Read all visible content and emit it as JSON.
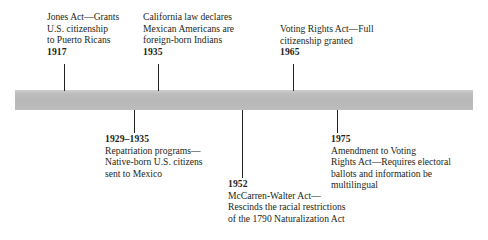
{
  "figure": {
    "type": "horizontal-timeline",
    "title": "",
    "bar": {
      "color": "#b7b7b7",
      "highlight_color": "#d2d2d2",
      "left": 15,
      "top": 90,
      "width": 458,
      "height": 20
    },
    "line_color": "#231f20",
    "background_color": "#ffffff"
  },
  "events_above": [
    {
      "year": "1917",
      "lines": [
        "Jones Act—Grants",
        "U.S. citizenship",
        "to Puerto Ricans"
      ],
      "text_left": 47,
      "text_top": 11,
      "connector_x": 64,
      "connector_top": 64,
      "connector_height": 27
    },
    {
      "year": "1935",
      "lines": [
        "California law declares",
        "Mexican Americans are",
        "foreign-born Indians"
      ],
      "text_left": 143,
      "text_top": 11,
      "connector_x": 158,
      "connector_top": 64,
      "connector_height": 27
    },
    {
      "year": "1965",
      "lines": [
        "Voting Rights Act—Full",
        "citizenship granted"
      ],
      "text_left": 280,
      "text_top": 23,
      "connector_x": 293,
      "connector_top": 64,
      "connector_height": 27
    }
  ],
  "events_below": [
    {
      "year": "1929–1935",
      "lines": [
        "Repatriation programs—",
        "Native-born U.S. citizens",
        "sent to Mexico"
      ],
      "text_left": 105,
      "text_top": 133,
      "connector_x": 134,
      "connector_top": 110,
      "connector_height": 23
    },
    {
      "year": "1952",
      "lines": [
        "McCarren-Walter Act—",
        "Rescinds the racial restrictions",
        "of the 1790 Naturalization Act"
      ],
      "text_left": 228,
      "text_top": 178,
      "connector_x": 242,
      "connector_top": 110,
      "connector_height": 68
    },
    {
      "year": "1975",
      "lines": [
        "Amendment to Voting",
        "Rights Act—Requires electoral",
        "ballots and information be",
        "multilingual"
      ],
      "text_left": 331,
      "text_top": 133,
      "connector_x": 337,
      "connector_top": 110,
      "connector_height": 23
    }
  ]
}
